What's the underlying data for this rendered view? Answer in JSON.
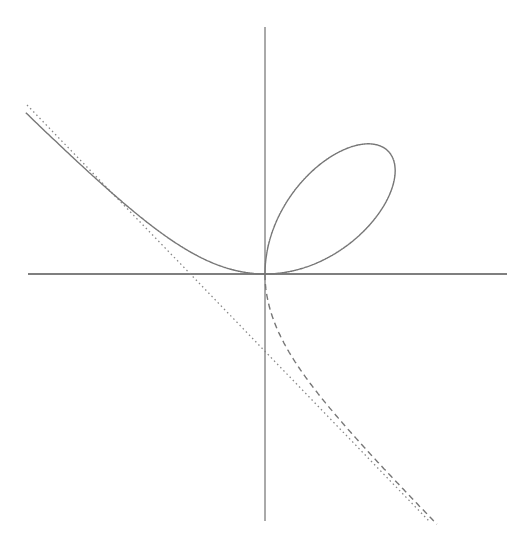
{
  "diagram": {
    "equation": "x^3 + y^3 = 3axy",
    "origin_px": [
      265,
      274
    ],
    "scale_a_px": 82,
    "colors": {
      "background": "#ffffff",
      "axes": "#555555",
      "curve": "#777777",
      "asymptote": "#888888"
    },
    "axes": {
      "horizontal": {
        "x1": 28,
        "x2": 507,
        "y": 274
      },
      "vertical": {
        "x": 265,
        "y1": 27,
        "y2": 521
      }
    },
    "elements": [
      {
        "name": "solid-branch",
        "style": "solid",
        "description": "Loop in first quadrant plus left branch into second quadrant"
      },
      {
        "name": "dashed-branch",
        "style": "dashed",
        "description": "Branch in fourth quadrant approaching asymptote"
      },
      {
        "name": "asymptote",
        "style": "dotted",
        "description": "Line x + y = -a",
        "from_px": [
          27,
          105
        ],
        "to_px": [
          429,
          521
        ]
      }
    ]
  }
}
